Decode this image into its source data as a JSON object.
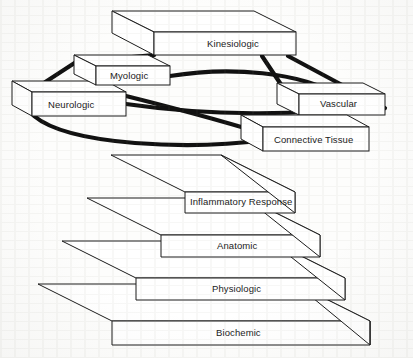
{
  "figure": {
    "type": "layered-network-diagram",
    "palette": {
      "ink": "#1a1a1a",
      "face": "#ffffff",
      "background": "#fdfdfc",
      "link": "#111111"
    },
    "network_title": "",
    "stack_title": ""
  },
  "network": {
    "description": "Interconnected 3D slabs forming a mutually-linked system layer",
    "nodes": [
      {
        "id": "kinesiologic",
        "label": "Kinesiologic",
        "front": {
          "x": 154,
          "y": 32,
          "w": 142,
          "h": 23
        },
        "depth": {
          "dx": -42,
          "dy": -21
        }
      },
      {
        "id": "myologic",
        "label": "Myologic",
        "front": {
          "x": 96,
          "y": 66,
          "w": 74,
          "h": 19
        },
        "depth": {
          "dx": -22,
          "dy": -11
        }
      },
      {
        "id": "neurologic",
        "label": "Neurologic",
        "front": {
          "x": 32,
          "y": 92,
          "w": 94,
          "h": 24
        },
        "depth": {
          "dx": -20,
          "dy": -11
        }
      },
      {
        "id": "vascular",
        "label": "Vascular",
        "front": {
          "x": 299,
          "y": 94,
          "w": 86,
          "h": 21
        },
        "depth": {
          "dx": -22,
          "dy": -11
        }
      },
      {
        "id": "connective-tissue",
        "label": "Connective Tissue",
        "front": {
          "x": 263,
          "y": 127,
          "w": 106,
          "h": 24
        },
        "depth": {
          "dx": -22,
          "dy": -12
        }
      }
    ],
    "links": [
      {
        "from": "kinesiologic",
        "to": "myologic",
        "style": "straight"
      },
      {
        "from": "kinesiologic",
        "to": "neurologic",
        "style": "straight"
      },
      {
        "from": "kinesiologic",
        "to": "vascular",
        "style": "straight"
      },
      {
        "from": "kinesiologic",
        "to": "connective-tissue",
        "style": "straight"
      },
      {
        "from": "myologic",
        "to": "vascular",
        "style": "curve"
      },
      {
        "from": "myologic",
        "to": "connective-tissue",
        "style": "curve"
      },
      {
        "from": "neurologic",
        "to": "vascular",
        "style": "curve"
      },
      {
        "from": "neurologic",
        "to": "connective-tissue",
        "style": "curve"
      }
    ]
  },
  "stack": {
    "description": "Stacked 3D slabs, widest at the base",
    "layers": [
      {
        "id": "inflammatory-response",
        "label": "Inflammatory Response",
        "order": 1,
        "front": {
          "x": 185,
          "y": 192,
          "w": 110,
          "h": 21
        },
        "depth": {
          "dx": -74,
          "dy": -37
        }
      },
      {
        "id": "anatomic",
        "label": "Anatomic",
        "order": 2,
        "front": {
          "x": 161,
          "y": 235,
          "w": 159,
          "h": 22
        },
        "depth": {
          "dx": -74,
          "dy": -37
        }
      },
      {
        "id": "physiologic",
        "label": "Physiologic",
        "order": 3,
        "front": {
          "x": 136,
          "y": 278,
          "w": 209,
          "h": 22
        },
        "depth": {
          "dx": -74,
          "dy": -37
        }
      },
      {
        "id": "biochemic",
        "label": "Biochemic",
        "order": 4,
        "front": {
          "x": 112,
          "y": 321,
          "w": 258,
          "h": 24
        },
        "depth": {
          "dx": -74,
          "dy": -37
        }
      }
    ]
  }
}
